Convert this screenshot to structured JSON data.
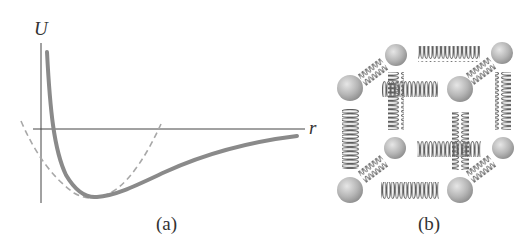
{
  "panel_a": {
    "y_axis_label": "U",
    "x_axis_label": "r",
    "caption": "(a)",
    "curve_color": "#8a8a8a",
    "dashed_color": "#a8a8a8",
    "axis_color": "#444444"
  },
  "panel_b": {
    "caption": "(b)",
    "sphere_color": "#b5b5b5",
    "spring_color": "#6a6a6a"
  }
}
